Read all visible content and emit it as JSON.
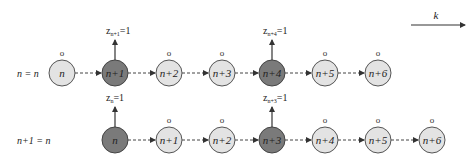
{
  "diagram": {
    "direction_label": "k",
    "rows": [
      {
        "label": "n = n",
        "y": 73,
        "nodes": [
          {
            "label": "n",
            "x": 62,
            "type": "light",
            "top": "o"
          },
          {
            "label": "n+1",
            "x": 115,
            "type": "dark",
            "top": "z",
            "z_base": "z",
            "z_sub": "n+1",
            "z_val": "=1"
          },
          {
            "label": "n+2",
            "x": 169,
            "type": "light",
            "top": "o"
          },
          {
            "label": "n+3",
            "x": 222,
            "type": "light",
            "top": "o"
          },
          {
            "label": "n+4",
            "x": 272,
            "type": "dark",
            "top": "z",
            "z_base": "z",
            "z_sub": "n+4",
            "z_val": "=1"
          },
          {
            "label": "n+5",
            "x": 325,
            "type": "light",
            "top": "o"
          },
          {
            "label": "n+6",
            "x": 378,
            "type": "light",
            "top": "o"
          }
        ]
      },
      {
        "label": "n+1 = n",
        "y": 140,
        "nodes": [
          {
            "label": "n",
            "x": 115,
            "type": "dark",
            "top": "z",
            "z_base": "z",
            "z_sub": "n",
            "z_val": "=1"
          },
          {
            "label": "n+1",
            "x": 169,
            "type": "light",
            "top": "o"
          },
          {
            "label": "n+2",
            "x": 222,
            "type": "light",
            "top": "o"
          },
          {
            "label": "n+3",
            "x": 272,
            "type": "dark",
            "top": "z",
            "z_base": "z",
            "z_sub": "n+3",
            "z_val": "=1"
          },
          {
            "label": "n+4",
            "x": 325,
            "type": "light",
            "top": "o"
          },
          {
            "label": "n+5",
            "x": 378,
            "type": "light",
            "top": "o"
          },
          {
            "label": "n+6",
            "x": 432,
            "type": "light",
            "top": "o"
          }
        ]
      }
    ],
    "o_marker": "o",
    "colors": {
      "light_node": "#e3e3e3",
      "dark_node": "#7a7a7a",
      "stroke": "#444444"
    }
  }
}
